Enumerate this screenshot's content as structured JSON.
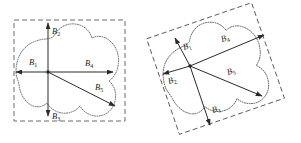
{
  "figure": {
    "background_color": "#ffffff",
    "width": 301,
    "height": 143,
    "panels": [
      {
        "id": "left-panel",
        "name": "axis-aligned-bounding-box-panel",
        "rotation_deg": 0,
        "description": "Blob shape with axis-aligned dashed bounding box and five labeled vectors from a central origin point",
        "origin": {
          "x": 48,
          "y": 72
        },
        "bbox": {
          "x": 14,
          "y": 20,
          "width": 111,
          "height": 101,
          "rotation_deg": 0
        },
        "vectors": [
          {
            "name": "B1",
            "label": "B",
            "subscript": "1",
            "from": {
              "x": 48,
              "y": 72
            },
            "to": {
              "x": 16,
              "y": 72
            },
            "label_pos": {
              "x": 29,
              "y": 65
            }
          },
          {
            "name": "B2",
            "label": "B",
            "subscript": "2",
            "from": {
              "x": 48,
              "y": 72
            },
            "to": {
              "x": 48,
              "y": 23
            },
            "label_pos": {
              "x": 52,
              "y": 34
            }
          },
          {
            "name": "B3",
            "label": "B",
            "subscript": "3",
            "from": {
              "x": 48,
              "y": 72
            },
            "to": {
              "x": 48,
              "y": 116
            },
            "label_pos": {
              "x": 52,
              "y": 119
            }
          },
          {
            "name": "B4",
            "label": "B",
            "subscript": "4",
            "from": {
              "x": 48,
              "y": 72
            },
            "to": {
              "x": 113,
              "y": 72
            },
            "label_pos": {
              "x": 85,
              "y": 66
            }
          },
          {
            "name": "B5",
            "label": "B",
            "subscript": "5",
            "from": {
              "x": 48,
              "y": 72
            },
            "to": {
              "x": 115,
              "y": 106
            },
            "label_pos": {
              "x": 95,
              "y": 90
            }
          }
        ]
      },
      {
        "id": "right-panel",
        "name": "rotated-bounding-box-panel",
        "rotation_deg": -19,
        "description": "Same blob shape rotated, with rotated dashed bounding box and five labeled vectors from a central origin point",
        "origin": {
          "x": 190,
          "y": 66
        },
        "bbox": {
          "x": 160,
          "y": 18,
          "width": 111,
          "height": 101,
          "rotation_deg": -19
        },
        "vectors": [
          {
            "name": "B1",
            "label": "B",
            "subscript": "1",
            "from": {
              "x": 190,
              "y": 66
            },
            "to": {
              "x": 175,
              "y": 38
            },
            "label_pos": {
              "x": 184,
              "y": 50
            }
          },
          {
            "name": "B2",
            "label": "B",
            "subscript": "2",
            "from": {
              "x": 190,
              "y": 66
            },
            "to": {
              "x": 163,
              "y": 74
            },
            "label_pos": {
              "x": 169,
              "y": 84
            }
          },
          {
            "name": "B3",
            "label": "B",
            "subscript": "3",
            "from": {
              "x": 190,
              "y": 66
            },
            "to": {
              "x": 210,
              "y": 125
            },
            "label_pos": {
              "x": 213,
              "y": 113
            }
          },
          {
            "name": "B4",
            "label": "B",
            "subscript": "4",
            "from": {
              "x": 190,
              "y": 66
            },
            "to": {
              "x": 264,
              "y": 35
            },
            "label_pos": {
              "x": 222,
              "y": 42
            }
          },
          {
            "name": "B5",
            "label": "B",
            "subscript": "5",
            "from": {
              "x": 190,
              "y": 66
            },
            "to": {
              "x": 262,
              "y": 96
            },
            "label_pos": {
              "x": 228,
              "y": 75
            }
          }
        ]
      }
    ],
    "colors": {
      "bbox_stroke": "#5a5a5a",
      "blob_stroke": "#4a4a4a",
      "vector_stroke": "#2b2b2b",
      "label_fill": "#1c1c1c",
      "background": "#ffffff"
    }
  }
}
